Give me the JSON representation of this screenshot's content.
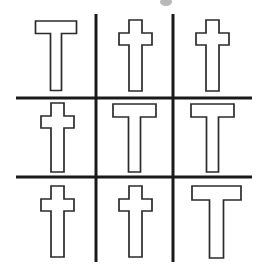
{
  "figure": {
    "title": "",
    "background_color": "#ffffff",
    "line_color": "#1a1a1a",
    "glyph_stroke_color": "#2b2b2b",
    "glyph_fill_color": "#ffffff",
    "dot_color": "#b8b8b8",
    "width": 266,
    "height": 268
  },
  "grid": {
    "rows": 3,
    "columns": 3,
    "vertical_lines_x": [
      96,
      173
    ],
    "horizontal_lines_y": [
      98,
      177
    ],
    "line_thickness": 3,
    "grid_left": 16,
    "grid_right": 252,
    "grid_top": 14,
    "grid_bottom": 262
  },
  "cells": [
    {
      "position": "top-left",
      "row": 1,
      "column": 1,
      "symbol": "T",
      "symbol_name": "letter-t",
      "glyph_label": "T"
    },
    {
      "position": "top-center",
      "row": 1,
      "column": 2,
      "symbol": "†",
      "symbol_name": "latin-cross",
      "glyph_label": "cross"
    },
    {
      "position": "top-right",
      "row": 1,
      "column": 3,
      "symbol": "†",
      "symbol_name": "latin-cross",
      "glyph_label": "cross"
    },
    {
      "position": "middle-left",
      "row": 2,
      "column": 1,
      "symbol": "†",
      "symbol_name": "latin-cross",
      "glyph_label": "cross"
    },
    {
      "position": "middle-center",
      "row": 2,
      "column": 2,
      "symbol": "T",
      "symbol_name": "letter-t",
      "glyph_label": "T"
    },
    {
      "position": "middle-right",
      "row": 2,
      "column": 3,
      "symbol": "T",
      "symbol_name": "letter-t",
      "glyph_label": "T"
    },
    {
      "position": "bottom-left",
      "row": 3,
      "column": 1,
      "symbol": "†",
      "symbol_name": "latin-cross",
      "glyph_label": "cross"
    },
    {
      "position": "bottom-center",
      "row": 3,
      "column": 2,
      "symbol": "†",
      "symbol_name": "latin-cross",
      "glyph_label": "cross"
    },
    {
      "position": "bottom-right",
      "row": 3,
      "column": 3,
      "symbol": "T",
      "symbol_name": "letter-t",
      "glyph_label": "T"
    }
  ],
  "marker_dot": {
    "visible": true,
    "center_x": 166,
    "center_y": 2,
    "radius_x": 6,
    "radius_y": 4
  }
}
